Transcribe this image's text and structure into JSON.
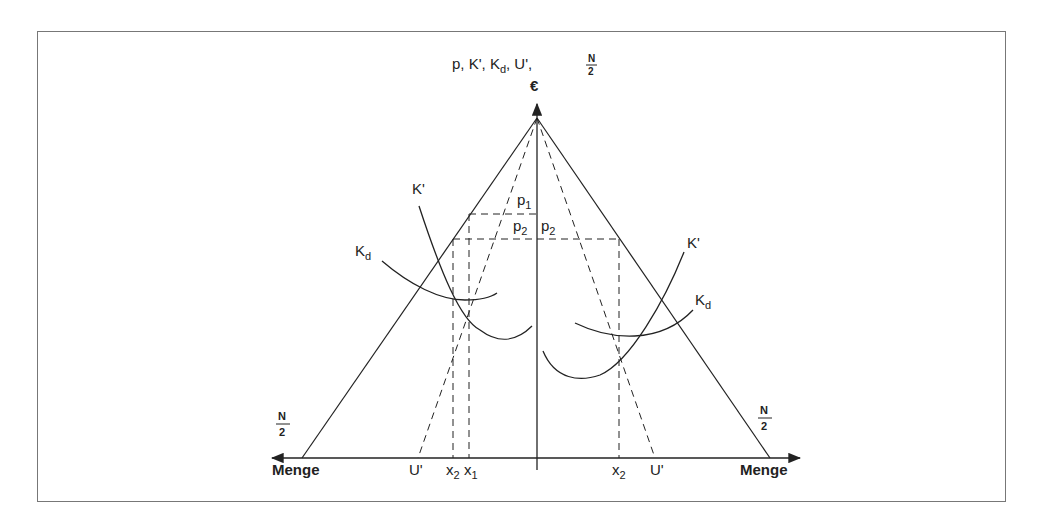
{
  "diagram": {
    "y_axis_label": "p, K', K_d, U', N/2",
    "y_axis_label_parts": {
      "p": "p, K', K",
      "d": "d",
      "u": ", U', ",
      "frac_num": "N",
      "frac_den": "2"
    },
    "y_axis_unit": "€",
    "x_axis_left_label": "Menge",
    "x_axis_right_label": "Menge",
    "left_N2": {
      "num": "N",
      "den": "2"
    },
    "right_N2": {
      "num": "N",
      "den": "2"
    },
    "left_curves": {
      "marginal_cost": "K'",
      "avg_cost": "K",
      "avg_cost_sub": "d"
    },
    "right_curves": {
      "marginal_cost": "K'",
      "avg_cost": "K",
      "avg_cost_sub": "d"
    },
    "price_labels": {
      "p1": "p",
      "p1_sub": "1",
      "p2_left": "p",
      "p2_left_sub": "2",
      "p2_right": "p",
      "p2_right_sub": "2"
    },
    "x_ticks_left": [
      {
        "label": "U'",
        "sub": ""
      },
      {
        "label": "x",
        "sub": "2"
      },
      {
        "label": "x",
        "sub": "1"
      }
    ],
    "x_ticks_right": [
      {
        "label": "x",
        "sub": "2"
      },
      {
        "label": "U'",
        "sub": ""
      }
    ]
  }
}
